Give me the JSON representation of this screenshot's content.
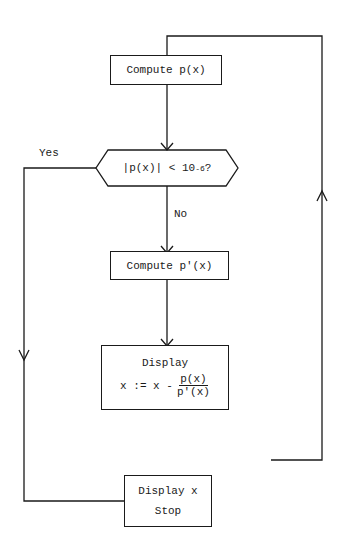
{
  "nodes": {
    "compute_p": {
      "label": "Compute p(x)"
    },
    "decision": {
      "abs_left": "|",
      "expr": "p(x)",
      "abs_right": "|",
      "op": " < 10",
      "exp": "-6",
      "q": "?"
    },
    "compute_dp": {
      "label": "Compute p'(x)"
    },
    "update": {
      "title": "Display",
      "lhs": "x := x -",
      "num": "p(x)",
      "den": "p'(x)"
    },
    "stop": {
      "line1": "Display x",
      "line2": "Stop"
    }
  },
  "edges": {
    "yes_label": "Yes",
    "no_label": "No"
  }
}
